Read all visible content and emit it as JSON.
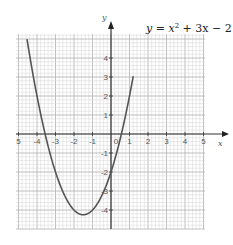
{
  "chart_data": {
    "type": "line",
    "title_parts": {
      "lhs": "y = ",
      "x": "x",
      "sup": "2",
      "rest": " + 3x − 2"
    },
    "xlabel": "x",
    "ylabel": "y",
    "xlim": [
      -5,
      5
    ],
    "ylim": [
      -5,
      5
    ],
    "grid": true,
    "minor_grid_step": 0.2,
    "x_ticks": [
      -5,
      -4,
      -3,
      -2,
      -1,
      0,
      1,
      2,
      3,
      4,
      5
    ],
    "x_tick_labels": [
      "5",
      "-4",
      "-3",
      "-2",
      "-1",
      "0",
      "1",
      "2",
      "3",
      "4",
      "5"
    ],
    "y_ticks": [
      4,
      3,
      2,
      1,
      -1,
      -2,
      -3,
      -4
    ],
    "y_tick_labels": [
      "4",
      "3",
      "2",
      "1",
      "-1",
      "-2",
      "-3",
      "-4"
    ],
    "series": [
      {
        "name": "y = x^2 + 3x - 2",
        "function": "x^2 + 3x - 2",
        "x": [
          -4.4,
          -4,
          -3.5,
          -3,
          -2.5,
          -2,
          -1.5,
          -1,
          -0.5,
          0,
          0.5,
          0.9
        ],
        "values": [
          4.16,
          2,
          0.75,
          -2,
          -3.25,
          -4,
          -4.25,
          -4,
          -3.25,
          -2,
          -0.25,
          1.51
        ],
        "vertex": [
          -1.5,
          -4.25
        ],
        "roots": [
          -3.56,
          0.56
        ]
      }
    ],
    "colors": {
      "curve": "#555555",
      "axis": "#333333",
      "grid_minor": "#d4d4d4",
      "grid_major": "#b0b0b0"
    }
  }
}
